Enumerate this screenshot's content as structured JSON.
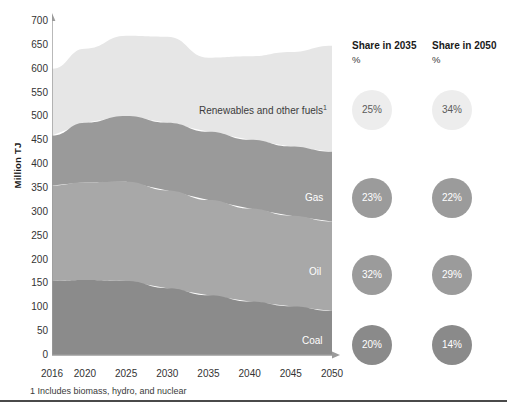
{
  "axis": {
    "y_title": "Million TJ",
    "y_ticks": [
      "0",
      "50",
      "100",
      "150",
      "200",
      "250",
      "300",
      "350",
      "400",
      "450",
      "500",
      "550",
      "600",
      "650",
      "700"
    ],
    "x_ticks": [
      "2016",
      "2020",
      "2025",
      "2030",
      "2035",
      "2040",
      "2045",
      "2050"
    ]
  },
  "series_labels": {
    "renewables": "Renewables and other fuels",
    "renewables_footnote_marker": "1",
    "gas": "Gas",
    "oil": "Oil",
    "coal": "Coal"
  },
  "share_columns": [
    {
      "header": "Share in 2035",
      "unit": "%",
      "bubbles": [
        {
          "label": "25%",
          "series": "Renewables and other fuels"
        },
        {
          "label": "23%",
          "series": "Gas"
        },
        {
          "label": "32%",
          "series": "Oil"
        },
        {
          "label": "20%",
          "series": "Coal"
        }
      ]
    },
    {
      "header": "Share in 2050",
      "unit": "%",
      "bubbles": [
        {
          "label": "34%",
          "series": "Renewables and other fuels"
        },
        {
          "label": "22%",
          "series": "Gas"
        },
        {
          "label": "29%",
          "series": "Oil"
        },
        {
          "label": "14%",
          "series": "Coal"
        }
      ]
    }
  ],
  "footnote": "1 Includes biomass, hydro, and nuclear",
  "colors": {
    "renewables": "#e6e6e6",
    "gas": "#9a9a9a",
    "oil": "#a8a8a8",
    "coal": "#8b8b8b",
    "axis": "#9b9b9b"
  },
  "chart_data": {
    "type": "area",
    "title": "",
    "xlabel": "",
    "ylabel": "Million TJ",
    "ylim": [
      0,
      700
    ],
    "grid": false,
    "stacked": true,
    "legend": "in-plot labels",
    "x": [
      2016,
      2020,
      2025,
      2030,
      2035,
      2040,
      2045,
      2050
    ],
    "series": [
      {
        "name": "Coal",
        "values": [
          155,
          157,
          155,
          140,
          125,
          112,
          102,
          92
        ]
      },
      {
        "name": "Oil",
        "values": [
          200,
          205,
          208,
          205,
          200,
          195,
          190,
          188
        ]
      },
      {
        "name": "Gas",
        "values": [
          105,
          125,
          138,
          142,
          143,
          144,
          145,
          146
        ]
      },
      {
        "name": "Renewables and other fuels",
        "values": [
          140,
          155,
          168,
          180,
          155,
          175,
          198,
          222
        ]
      }
    ],
    "totals": [
      600,
      642,
      669,
      667,
      623,
      626,
      635,
      648
    ],
    "annotations": [
      "Share in 2035 %: Renewables 25%, Gas 23%, Oil 32%, Coal 20%",
      "Share in 2050 %: Renewables 34%, Gas 22%, Oil 29%, Coal 14%",
      "1 Includes biomass, hydro, and nuclear"
    ]
  }
}
